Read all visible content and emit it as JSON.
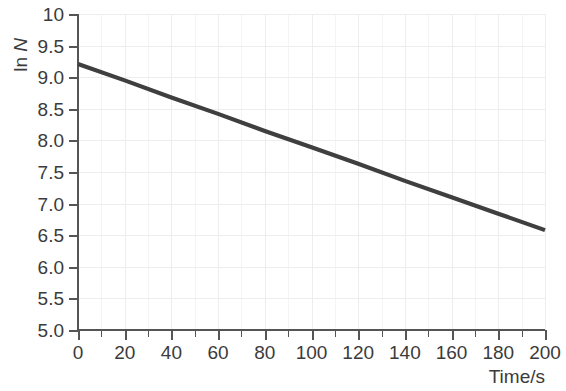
{
  "chart_data": {
    "type": "line",
    "title": "",
    "subtitle": "",
    "xlabel": "Time/s",
    "ylabel": "ln N",
    "ylabel_parts": {
      "prefix": "ln ",
      "italic": "N"
    },
    "xlim": [
      0,
      200
    ],
    "ylim": [
      5.0,
      10.0
    ],
    "x_tick_step": 20,
    "x_minor_step": 10,
    "y_tick_step": 0.5,
    "grid": true,
    "grid_color": "#f0f0f0",
    "legend": null,
    "line_color": "#3f3f3f",
    "axis_color": "#555555",
    "text_color": "#3b3b3b",
    "x_ticks": [
      "0",
      "20",
      "40",
      "60",
      "80",
      "100",
      "120",
      "140",
      "160",
      "180",
      "200"
    ],
    "x_tick_values": [
      0,
      20,
      40,
      60,
      80,
      100,
      120,
      140,
      160,
      180,
      200
    ],
    "y_ticks": [
      "5.0",
      "5.5",
      "6.0",
      "6.5",
      "7.0",
      "7.5",
      "8.0",
      "8.5",
      "9.0",
      "9.5",
      "10"
    ],
    "y_tick_values": [
      5.0,
      5.5,
      6.0,
      6.5,
      7.0,
      7.5,
      8.0,
      8.5,
      9.0,
      9.5,
      10.0
    ],
    "series": [
      {
        "name": "ln N vs time",
        "x": [
          0,
          20,
          40,
          60,
          80,
          100,
          120,
          140,
          160,
          180,
          200
        ],
        "values": [
          9.21,
          8.95,
          8.68,
          8.42,
          8.15,
          7.89,
          7.63,
          7.36,
          7.1,
          6.84,
          6.58
        ]
      }
    ]
  }
}
